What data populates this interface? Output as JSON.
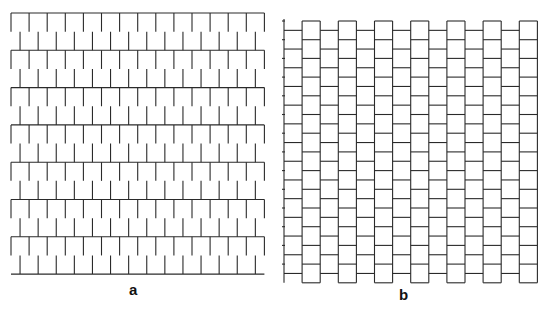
{
  "figure": {
    "width": 551,
    "height": 310,
    "stroke_color": "#2a2a2a",
    "stroke_width": 1.1,
    "background": "#ffffff"
  },
  "panels": [
    {
      "id": "a",
      "label": "a",
      "label_pos": [
        129,
        282
      ],
      "orientation": "horizontal-running-bond",
      "origin": [
        11,
        13
      ],
      "courses": 14,
      "units_per_course": 14,
      "unit_length": 18.1,
      "unit_thickness": 18.65,
      "offset_fraction": 0.5
    },
    {
      "id": "b",
      "label": "b",
      "label_pos": [
        399,
        287
      ],
      "orientation": "vertical-running-bond",
      "origin": [
        284,
        21
      ],
      "courses": 14,
      "units_per_course": 14,
      "unit_length": 18.7,
      "unit_thickness": 18.1,
      "offset_fraction": 0.5
    }
  ]
}
